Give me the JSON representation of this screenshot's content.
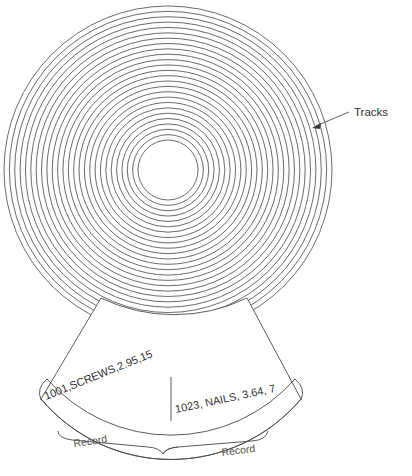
{
  "figure": {
    "annotations": {
      "tracks_label": "Tracks"
    },
    "disk": {
      "center_x": 168,
      "center_y": 170,
      "outer_radius": 164,
      "hole_radius": 30,
      "track_count": 25,
      "track_color": "#5a5a5a"
    },
    "sector": {
      "records": [
        {
          "text": "1001,SCREWS,2.95,15",
          "label": "Record"
        },
        {
          "text": "1023, NAILS, 3.64, 7",
          "label": "Record"
        }
      ]
    },
    "colors": {
      "ink": "#4a4a4a",
      "text": "#2e2e2e",
      "background": "#ffffff"
    }
  }
}
